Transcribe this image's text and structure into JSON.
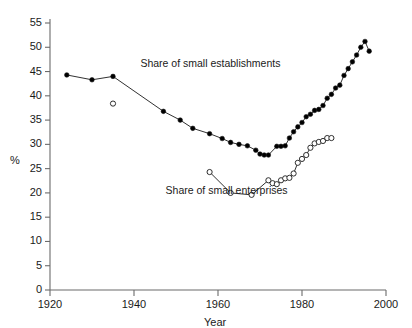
{
  "chart_data": {
    "type": "line",
    "title": "",
    "xlabel": "Year",
    "ylabel": "%",
    "xlim": [
      1920,
      2000
    ],
    "ylim": [
      0,
      55
    ],
    "xticks": [
      1920,
      1940,
      1960,
      1980,
      2000
    ],
    "yticks": [
      0,
      5,
      10,
      15,
      20,
      25,
      30,
      35,
      40,
      45,
      50,
      55
    ],
    "grid": false,
    "legend_position": "inline-annotations",
    "annotations": [
      {
        "text": "Share of small establishments",
        "x": 1942,
        "y": 46.5
      },
      {
        "text": "Share of small enterprises",
        "x": 1948,
        "y": 20.3
      }
    ],
    "series": [
      {
        "name": "Share of small establishments",
        "marker": "filled-circle",
        "color": "#000000",
        "points": [
          {
            "x": 1924,
            "y": 44.3
          },
          {
            "x": 1930,
            "y": 43.3
          },
          {
            "x": 1935,
            "y": 44.0
          },
          {
            "x": 1947,
            "y": 36.8
          },
          {
            "x": 1951,
            "y": 35.0
          },
          {
            "x": 1954,
            "y": 33.3
          },
          {
            "x": 1958,
            "y": 32.2
          },
          {
            "x": 1961,
            "y": 31.2
          },
          {
            "x": 1963,
            "y": 30.4
          },
          {
            "x": 1965,
            "y": 30.0
          },
          {
            "x": 1967,
            "y": 29.7
          },
          {
            "x": 1969,
            "y": 28.8
          },
          {
            "x": 1970,
            "y": 28.0
          },
          {
            "x": 1971,
            "y": 27.8
          },
          {
            "x": 1972,
            "y": 27.8
          },
          {
            "x": 1974,
            "y": 29.6
          },
          {
            "x": 1975,
            "y": 29.6
          },
          {
            "x": 1976,
            "y": 29.7
          },
          {
            "x": 1977,
            "y": 31.3
          },
          {
            "x": 1978,
            "y": 32.6
          },
          {
            "x": 1979,
            "y": 33.6
          },
          {
            "x": 1980,
            "y": 34.5
          },
          {
            "x": 1981,
            "y": 35.7
          },
          {
            "x": 1982,
            "y": 36.2
          },
          {
            "x": 1983,
            "y": 37.0
          },
          {
            "x": 1984,
            "y": 37.2
          },
          {
            "x": 1985,
            "y": 38.0
          },
          {
            "x": 1986,
            "y": 39.5
          },
          {
            "x": 1987,
            "y": 40.3
          },
          {
            "x": 1988,
            "y": 41.6
          },
          {
            "x": 1989,
            "y": 42.2
          },
          {
            "x": 1990,
            "y": 44.2
          },
          {
            "x": 1991,
            "y": 45.6
          },
          {
            "x": 1992,
            "y": 47.0
          },
          {
            "x": 1993,
            "y": 48.4
          },
          {
            "x": 1994,
            "y": 50.0
          },
          {
            "x": 1995,
            "y": 51.2
          },
          {
            "x": 1996,
            "y": 49.2
          }
        ]
      },
      {
        "name": "Share of small enterprises",
        "marker": "open-circle",
        "color": "#000000",
        "orphan_points": [
          {
            "x": 1935,
            "y": 38.4
          }
        ],
        "points": [
          {
            "x": 1958,
            "y": 24.3
          },
          {
            "x": 1963,
            "y": 20.0
          },
          {
            "x": 1968,
            "y": 19.6
          },
          {
            "x": 1972,
            "y": 22.6
          },
          {
            "x": 1973,
            "y": 22.0
          },
          {
            "x": 1974,
            "y": 21.8
          },
          {
            "x": 1975,
            "y": 22.6
          },
          {
            "x": 1976,
            "y": 23.0
          },
          {
            "x": 1977,
            "y": 23.1
          },
          {
            "x": 1978,
            "y": 24.0
          },
          {
            "x": 1979,
            "y": 26.2
          },
          {
            "x": 1980,
            "y": 27.0
          },
          {
            "x": 1981,
            "y": 27.8
          },
          {
            "x": 1982,
            "y": 29.3
          },
          {
            "x": 1983,
            "y": 30.2
          },
          {
            "x": 1984,
            "y": 30.5
          },
          {
            "x": 1985,
            "y": 30.7
          },
          {
            "x": 1986,
            "y": 31.3
          },
          {
            "x": 1987,
            "y": 31.3
          }
        ]
      }
    ]
  },
  "axis": {
    "x_title": "Year",
    "y_title": "%",
    "x_tick_labels": [
      "1920",
      "1940",
      "1960",
      "1980",
      "2000"
    ],
    "y_tick_labels": [
      "0",
      "5",
      "10",
      "15",
      "20",
      "25",
      "30",
      "35",
      "40",
      "45",
      "50",
      "55"
    ]
  },
  "colors": {
    "axis": "#6b6b6b",
    "line": "#1a1a1a",
    "marker_fill": "#000000",
    "marker_open": "#ffffff",
    "text": "#1a1a1a",
    "background": "#ffffff"
  }
}
